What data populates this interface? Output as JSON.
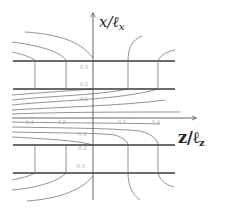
{
  "figure": {
    "x_axis_label": "x/ℓx",
    "z_axis_label": "z/ℓz",
    "x_label_main": "x/ℓ",
    "x_label_sub": "x",
    "z_label_main": "z/ℓ",
    "z_label_sub": "z",
    "x_ticks": [
      "0.3",
      "0.2",
      "0.1",
      "-0.1",
      "-0.2",
      "-0.3"
    ],
    "z_ticks": [
      "-0.4",
      "-0.2",
      "0.2",
      "0.4"
    ],
    "colors": {
      "thick_lines": "#3a3a3a",
      "contours": "#777777",
      "tick_labels": "#a8a8a8"
    }
  }
}
